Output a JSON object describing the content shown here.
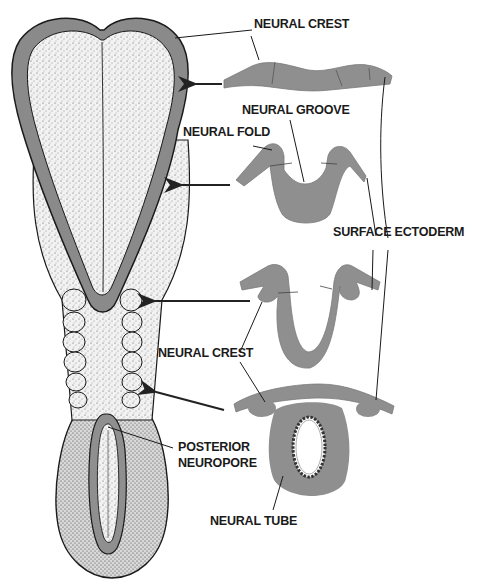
{
  "figure": {
    "type": "embryology-diagram",
    "colors": {
      "tissue_gray": "#8f8f8f",
      "neural_plate_border": "#7d7d7d",
      "stipple_embryo": "#e9e9e9",
      "outline": "#1a1a1a",
      "background": "#ffffff"
    }
  },
  "labels": {
    "neural_crest_top": "NEURAL CREST",
    "neural_groove": "NEURAL GROOVE",
    "neural_fold": "NEURAL FOLD",
    "surface_ectoderm": "SURFACE ECTODERM",
    "neural_crest_mid": "NEURAL CREST",
    "posterior_neuropore_line1": "POSTERIOR",
    "posterior_neuropore_line2": "NEUROPORE",
    "neural_tube": "NEURAL TUBE"
  },
  "sections": [
    {
      "stage": 1,
      "name": "neural plate section",
      "arrow_target_y": 85
    },
    {
      "stage": 2,
      "name": "neural groove section",
      "arrow_target_y": 185
    },
    {
      "stage": 3,
      "name": "closing neural folds section",
      "arrow_target_y": 300
    },
    {
      "stage": 4,
      "name": "neural tube section",
      "arrow_target_y": 395
    }
  ],
  "caption": {
    "text": ""
  }
}
